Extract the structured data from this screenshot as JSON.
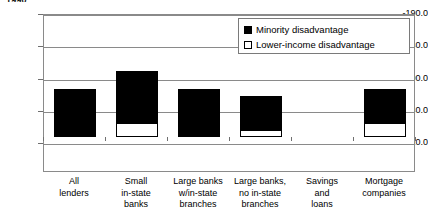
{
  "chart_data": {
    "type": "bar",
    "title": "",
    "xlabel": "",
    "ylabel": "",
    "stacked": true,
    "grid": true,
    "legend_position": "top-right",
    "yaxis_inverted": true,
    "ylim": [
      -190.0,
      10.0
    ],
    "yticks": [
      -190.0,
      -140.0,
      -90.0,
      -40.0,
      10.0
    ],
    "ytick_labels": [
      "-190.0",
      "-140.0",
      "-90.0",
      "-40.0",
      "10.0"
    ],
    "categories": [
      "All lenders",
      "Small in-state banks",
      "Large banks w/in-state branches",
      "Large banks, no in-state branches",
      "Savings and loans",
      "Mortgage companies"
    ],
    "category_lines": [
      [
        "All",
        "lenders"
      ],
      [
        "Small",
        "in-state",
        "banks"
      ],
      [
        "Large banks",
        "w/in-state",
        "branches"
      ],
      [
        "Large banks,",
        "no in-state",
        "branches"
      ],
      [
        "Savings",
        "and",
        "loans"
      ],
      [
        "Mortgage",
        "companies"
      ]
    ],
    "series": [
      {
        "name": "Minority disadvantage",
        "color": "#000000",
        "values": [
          -75.0,
          -103.0,
          -75.0,
          -64.0,
          0.0,
          -75.0
        ]
      },
      {
        "name": "Lower-income disadvantage",
        "color": "#ffffff",
        "values": [
          0.0,
          -22.0,
          0.0,
          -11.0,
          0.0,
          -22.0
        ]
      }
    ]
  },
  "top_title": {
    "text": "1990"
  },
  "legend": {
    "entries": [
      {
        "label": "Minority disadvantage",
        "swatch": "filled"
      },
      {
        "label": "Lower-income disadvantage",
        "swatch": "hollow"
      }
    ]
  }
}
